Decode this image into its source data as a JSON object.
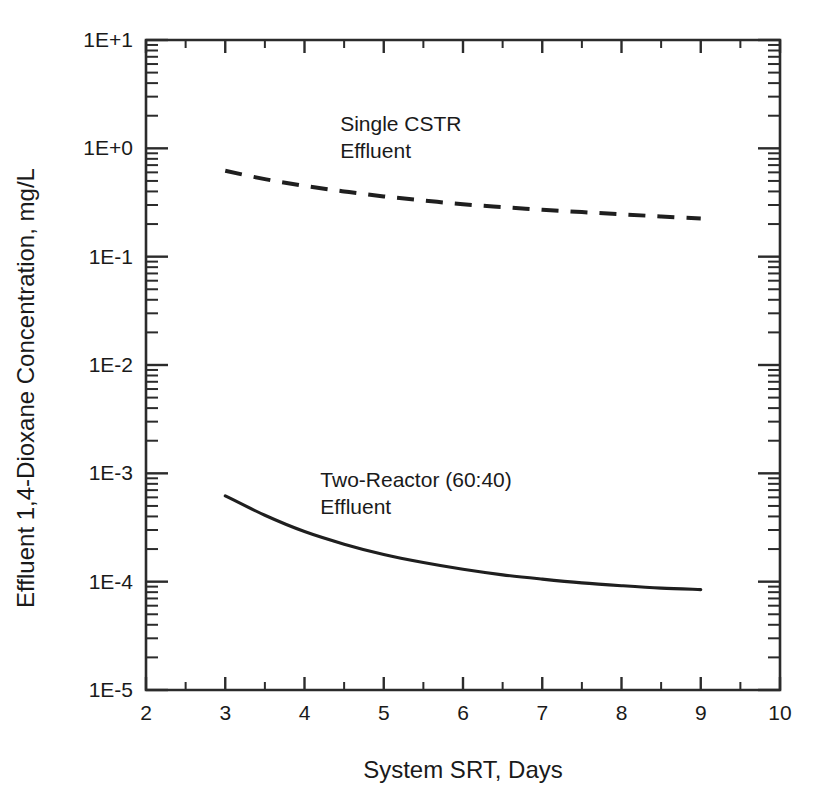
{
  "figure": {
    "background_color": "#ffffff",
    "ink_color": "#1f1f1f"
  },
  "chart_data": {
    "type": "line",
    "title": "",
    "xlabel": "System SRT, Days",
    "ylabel": "Effluent 1,4-Dioxane Concentration, mg/L",
    "xscale": "linear",
    "yscale": "log",
    "xlim": [
      2,
      10
    ],
    "ylim": [
      1e-05,
      10
    ],
    "grid": false,
    "legend_position": "inline-annotation",
    "x_tick_labels": [
      "2",
      "3",
      "4",
      "5",
      "6",
      "7",
      "8",
      "9",
      "10"
    ],
    "x_ticks": [
      2,
      3,
      4,
      5,
      6,
      7,
      8,
      9,
      10
    ],
    "x_minor_ticks": [
      2.5,
      3.5,
      4.5,
      5.5,
      6.5,
      7.5,
      8.5,
      9.5
    ],
    "y_tick_labels": [
      "1E+1",
      "1E+0",
      "1E-1",
      "1E-2",
      "1E-3",
      "1E-4",
      "1E-5"
    ],
    "y_ticks": [
      10,
      1,
      0.1,
      0.01,
      0.001,
      0.0001,
      1e-05
    ],
    "series": [
      {
        "name": "Single CSTR Effluent",
        "style": "dashed",
        "label_line1": "Single CSTR",
        "label_line2": "Effluent",
        "x": [
          3.0,
          3.5,
          4.0,
          4.5,
          5.0,
          5.5,
          6.0,
          6.5,
          7.0,
          7.5,
          8.0,
          8.5,
          9.0
        ],
        "y": [
          0.62,
          0.52,
          0.45,
          0.4,
          0.36,
          0.33,
          0.305,
          0.287,
          0.271,
          0.258,
          0.246,
          0.235,
          0.225
        ]
      },
      {
        "name": "Two-Reactor (60:40) Effluent",
        "style": "solid",
        "label_line1": "Two-Reactor (60:40)",
        "label_line2": "Effluent",
        "x": [
          3.0,
          3.5,
          4.0,
          4.5,
          5.0,
          5.5,
          6.0,
          6.5,
          7.0,
          7.5,
          8.0,
          8.5,
          9.0
        ],
        "y": [
          0.00062,
          0.00041,
          0.00029,
          0.000222,
          0.000178,
          0.00015,
          0.00013,
          0.0001155,
          0.0001055,
          9.75e-05,
          9.18e-05,
          8.72e-05,
          8.45e-05
        ]
      }
    ],
    "annotations": [
      {
        "text_line1": "Single CSTR",
        "text_line2": "Effluent",
        "x": 4.45,
        "y": 1.45
      },
      {
        "text_line1": "Two-Reactor (60:40)",
        "text_line2": "Effluent",
        "x": 4.2,
        "y": 0.00075
      }
    ]
  }
}
